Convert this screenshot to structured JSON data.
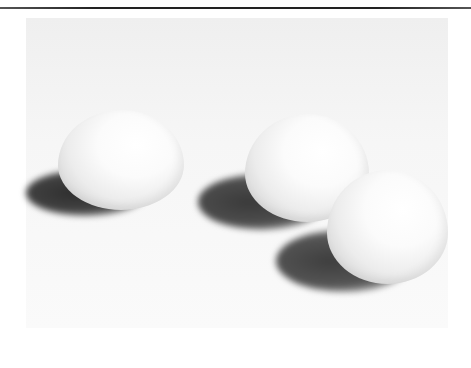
{
  "image": {
    "subject": "Three white eggs on a white surface casting shadows to the left",
    "colors": {
      "background": "#f5f5f5",
      "egg": "#fafafa",
      "shadow": "#3a3a3a",
      "rule": "#222222"
    },
    "objects": [
      {
        "name": "egg-left",
        "x": 58,
        "y": 110,
        "w": 126,
        "h": 100
      },
      {
        "name": "egg-middle",
        "x": 245,
        "y": 114,
        "w": 124,
        "h": 108
      },
      {
        "name": "egg-right",
        "x": 327,
        "y": 170,
        "w": 120,
        "h": 114
      }
    ]
  }
}
